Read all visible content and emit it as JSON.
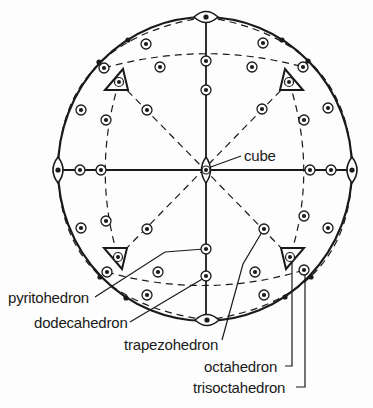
{
  "diagram": {
    "type": "stereographic-projection",
    "colors": {
      "ink": "#1a1a1a",
      "background": "#fdfdfd"
    },
    "primitive_circle": {
      "cx": 205,
      "cy": 169,
      "rx": 147,
      "ry": 152
    },
    "labels": {
      "cube": "cube",
      "pyritohedron": "pyritohedron",
      "dodecahedron": "dodecahedron",
      "trapezohedron": "trapezohedron",
      "octahedron": "octahedron",
      "trisoctahedron": "trisoctahedron"
    },
    "symmetry_symbols": {
      "fourfold_center": {
        "x": 206,
        "y": 170,
        "symbol": "lens-vertical"
      },
      "twofold": [
        {
          "x": 206,
          "y": 17,
          "orient": "horizontal"
        },
        {
          "x": 207,
          "y": 320,
          "orient": "horizontal"
        },
        {
          "x": 58,
          "y": 170,
          "orient": "vertical"
        },
        {
          "x": 352,
          "y": 170,
          "orient": "vertical"
        }
      ],
      "threefold_triangles": [
        {
          "x": 119,
          "y": 82,
          "dir": "up"
        },
        {
          "x": 289,
          "y": 82,
          "dir": "up"
        },
        {
          "x": 118,
          "y": 257,
          "dir": "down"
        },
        {
          "x": 290,
          "y": 257,
          "dir": "down"
        }
      ]
    },
    "rim_dots": [
      {
        "x": 128,
        "y": 40
      },
      {
        "x": 99,
        "y": 62
      },
      {
        "x": 282,
        "y": 40
      },
      {
        "x": 308,
        "y": 61
      },
      {
        "x": 100,
        "y": 277
      },
      {
        "x": 126,
        "y": 298
      },
      {
        "x": 285,
        "y": 297
      },
      {
        "x": 311,
        "y": 277
      }
    ],
    "poles": [
      {
        "x": 146,
        "y": 44
      },
      {
        "x": 263,
        "y": 43
      },
      {
        "x": 104,
        "y": 68
      },
      {
        "x": 303,
        "y": 67
      },
      {
        "x": 160,
        "y": 67
      },
      {
        "x": 252,
        "y": 67
      },
      {
        "x": 206,
        "y": 61
      },
      {
        "x": 206,
        "y": 90
      },
      {
        "x": 81,
        "y": 110
      },
      {
        "x": 328,
        "y": 108
      },
      {
        "x": 106,
        "y": 120
      },
      {
        "x": 304,
        "y": 120
      },
      {
        "x": 147,
        "y": 110
      },
      {
        "x": 262,
        "y": 109
      },
      {
        "x": 80,
        "y": 170
      },
      {
        "x": 101,
        "y": 170
      },
      {
        "x": 310,
        "y": 170
      },
      {
        "x": 331,
        "y": 170
      },
      {
        "x": 106,
        "y": 221
      },
      {
        "x": 304,
        "y": 216
      },
      {
        "x": 81,
        "y": 228
      },
      {
        "x": 328,
        "y": 228
      },
      {
        "x": 147,
        "y": 229
      },
      {
        "x": 264,
        "y": 229
      },
      {
        "x": 206,
        "y": 249
      },
      {
        "x": 206,
        "y": 276
      },
      {
        "x": 107,
        "y": 272
      },
      {
        "x": 304,
        "y": 270
      },
      {
        "x": 158,
        "y": 272
      },
      {
        "x": 255,
        "y": 272
      },
      {
        "x": 147,
        "y": 295
      },
      {
        "x": 264,
        "y": 295
      }
    ],
    "leaders": {
      "cube": [
        [
          241,
          156
        ],
        [
          208,
          168
        ]
      ],
      "pyritohedron": [
        [
          95,
          297
        ],
        [
          165,
          252
        ],
        [
          204,
          249
        ]
      ],
      "dodecahedron": [
        [
          130,
          322
        ],
        [
          204,
          278
        ]
      ],
      "trapezohedron": [
        [
          222,
          340
        ],
        [
          243,
          264
        ],
        [
          262,
          232
        ]
      ],
      "octahedron": [
        [
          285,
          366
        ],
        [
          292,
          366
        ],
        [
          292,
          260
        ]
      ],
      "trisoctahedron": [
        [
          296,
          387
        ],
        [
          305,
          387
        ],
        [
          305,
          272
        ]
      ]
    }
  }
}
